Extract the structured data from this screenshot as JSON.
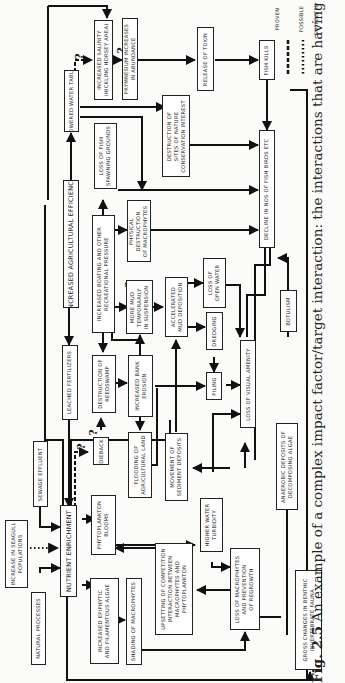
{
  "diagram": {
    "orientation": "rotated-90-ccw",
    "caption": {
      "fig_label": "Fig. 2.5",
      "text": " An example of a complex impact factor/target interaction: the interactions that are having to be considered in attempt"
    },
    "legend": {
      "items": [
        {
          "style": "solid",
          "label": "PROVEN"
        },
        {
          "style": "dashed",
          "label": "POSSIBLE"
        },
        {
          "style": "dotted",
          "label": "SUSPECTED"
        }
      ]
    },
    "nodes": {
      "natural_processes": "NATURAL PROCESSES",
      "seagull": "INCREASE IN SEAGULL\nPOPULATIONS",
      "sewage": "SEWAGE EFFLUENT",
      "nutrient": "NUTRIENT ENRICHMENT",
      "leached": "LEACHED FERTILIZERS",
      "agri_eff": "INCREASED AGRICULTURAL EFFICIENCY",
      "lowered_wt": "LOWERED WATER TABLE",
      "salinity": "INCREASED SALINITY\n(HICKLING HORSEY AREA)",
      "prymnesium": "PRYMNESIUM INCREASES\nIN ABUNDANCE",
      "toxin": "RELEASE OF TOXIN",
      "fish_kills": "FISH KILLS",
      "fish_spawn": "LOSS OF FISH\nSPAWNING GROUNDS",
      "destruction_sites": "DESTRUCTION OF\nSITES OF NATURE\nCONSERVATION INTEREST",
      "boating": "INCREASED BOATING AND OTHER\nRECREATIONAL PRESSURE",
      "phys_destr": "PHYSICAL\nDESTRUCTION\nOF MACROPHYTES",
      "more_mud": "MORE MUD\nTEMPORARILY\nIN SUSPENSION",
      "accel_mud": "ACCELERATED\nMUD DEPOSITION",
      "loss_open_water": "LOSS OF\nOPEN WATER",
      "dredging": "DREDGING",
      "piling": "PILING",
      "loss_visual": "LOSS OF VISUAL AMENITY",
      "decline": "DECLINE IN NOS OF FISH BIRDS ETC",
      "botulism": "BOTULISM",
      "dieback": "DIEBACK",
      "destr_reed": "DESTRUCTION OF\nREEDSWAMP",
      "bank_erosion": "INCREASED BANK\nEROSION",
      "flooding": "FLOODING OF\nAGRICULTURAL LAND",
      "sediment": "MOVEMENT OF\nSEDIMENT DEPOSITS",
      "phyto_blooms": "PHYTOPLANKTON\nBLOOMS",
      "higher_turb": "HIGHER WATER\nTURBIDITY",
      "anaerobic": "ANAEROBIC DEPOSITS OF\nDECOMPOSING ALGAE",
      "epiphytic": "INCREASED EPIPHYTIC\nAND FILAMENTOUS ALGAE",
      "shading": "SHADING OF MACROPHYTES",
      "upsetting": "UPSETTING OF COMPETITION\nINTERACTION BETWEEN\nMACROPHYTES AND\nPHYTOPLANKTON",
      "loss_macro": "LOSS OF MACROPHYTES\nAND PREVENTION\nOF REGROWTH",
      "benthic": "GROSS CHANGES IN BENTHIC\nINVERTEBRATE FAUNA"
    },
    "question_mark": "?"
  }
}
